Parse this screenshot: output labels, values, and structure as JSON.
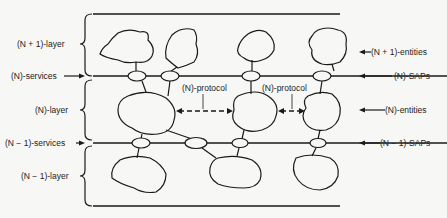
{
  "diagram": {
    "type": "layered-architecture",
    "left_labels": {
      "n_plus_1_layer": "(N + 1)-layer",
      "n_services": "(N)-services",
      "n_layer": "(N)-layer",
      "n_minus_1_services": "(N − 1)-services",
      "n_minus_1_layer": "(N − 1)-layer"
    },
    "right_labels": {
      "n_plus_1_entities": "(N + 1)-entities",
      "n_saps": "(N)-SAPs",
      "n_entities": "(N)-entities",
      "n_minus_1_saps": "(N − 1)-SAPs"
    },
    "protocol_labels": [
      "(N)-protocol",
      "(N)-protocol"
    ],
    "colors": {
      "line": "#1a1a1a",
      "background": "#f7f7f5"
    }
  }
}
